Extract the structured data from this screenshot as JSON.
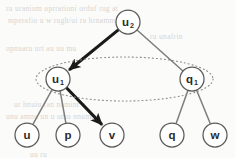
{
  "figure": {
    "kind": "graph-diagram",
    "width": 235,
    "height": 158,
    "background_color": "#fbfbfa"
  },
  "colors": {
    "node_stroke": "#5a5a5a",
    "node_fill": "#ffffff",
    "label_color": "#2b2b2b",
    "edge_normal": "#7d7d7d",
    "edge_highlight": "#1a1a1a",
    "ellipse_stroke": "#8a8a8a",
    "ghost_text": "#cfcdc9"
  },
  "nodes": [
    {
      "id": "u2",
      "label": "u",
      "subscript": "2",
      "cx": 128,
      "cy": 22,
      "r": 12
    },
    {
      "id": "u1",
      "label": "u",
      "subscript": "1",
      "cx": 58,
      "cy": 79,
      "r": 12
    },
    {
      "id": "q1",
      "label": "q",
      "subscript": "1",
      "cx": 192,
      "cy": 79,
      "r": 12
    },
    {
      "id": "u",
      "label": "u",
      "subscript": "",
      "cx": 27,
      "cy": 135,
      "r": 12
    },
    {
      "id": "p",
      "label": "p",
      "subscript": "",
      "cx": 68,
      "cy": 135,
      "r": 12
    },
    {
      "id": "v",
      "label": "v",
      "subscript": "",
      "cx": 112,
      "cy": 135,
      "r": 12
    },
    {
      "id": "q",
      "label": "q",
      "subscript": "",
      "cx": 172,
      "cy": 135,
      "r": 12
    },
    {
      "id": "w",
      "label": "w",
      "subscript": "",
      "cx": 215,
      "cy": 135,
      "r": 12
    }
  ],
  "edges": [
    {
      "from": "u2",
      "to": "u1",
      "style": "highlight",
      "arrow": true,
      "width": 3.1
    },
    {
      "from": "u2",
      "to": "q1",
      "style": "normal",
      "arrow": false,
      "width": 1.5
    },
    {
      "from": "u1",
      "to": "u",
      "style": "normal",
      "arrow": false,
      "width": 1.5
    },
    {
      "from": "u1",
      "to": "p",
      "style": "normal",
      "arrow": false,
      "width": 1.5
    },
    {
      "from": "u1",
      "to": "v",
      "style": "highlight",
      "arrow": true,
      "width": 3.1
    },
    {
      "from": "q1",
      "to": "q",
      "style": "normal",
      "arrow": false,
      "width": 1.5
    },
    {
      "from": "q1",
      "to": "w",
      "style": "normal",
      "arrow": false,
      "width": 1.5
    }
  ],
  "ellipse": {
    "name": "dotted-grouping-ellipse",
    "cx": 124.5,
    "cy": 79,
    "rx": 88.5,
    "ry": 22,
    "dash": "1 3",
    "encloses": [
      "u1",
      "q1"
    ]
  },
  "background_text": [
    {
      "text": "ru  uranium   oprrationi   orduf   rug  at",
      "x": 6,
      "y": 4
    },
    {
      "text": "mperafio   u   w  rugh/ui   ru  hrnamnu",
      "x": 8,
      "y": 16
    },
    {
      "text": "ru  unafrin",
      "x": 150,
      "y": 32
    },
    {
      "text": "opnuaru   urt  au  uu  mu",
      "x": 6,
      "y": 44
    },
    {
      "text": "ur  hnuiu   ran  naminr  u",
      "x": 14,
      "y": 100
    },
    {
      "text": "unu  amnu  un  u  umu   nnumar",
      "x": 6,
      "y": 112
    },
    {
      "text": "uu  ru",
      "x": 30,
      "y": 150
    }
  ]
}
